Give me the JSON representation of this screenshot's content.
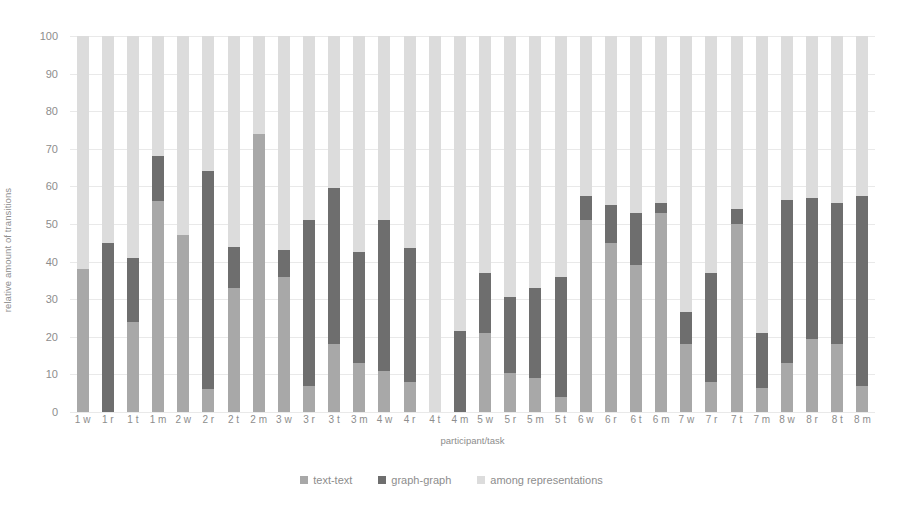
{
  "chart_data": {
    "type": "bar",
    "title": "",
    "xlabel": "participant/task",
    "ylabel": "relative amount of transitions",
    "ylim": [
      0,
      100
    ],
    "yticks": [
      0,
      10,
      20,
      30,
      40,
      50,
      60,
      70,
      80,
      90,
      100
    ],
    "grid": true,
    "stacked": true,
    "legend_position": "bottom",
    "categories": [
      "1 w",
      "1 r",
      "1 t",
      "1 m",
      "2 w",
      "2 r",
      "2 t",
      "2 m",
      "3 w",
      "3 r",
      "3 t",
      "3 m",
      "4 w",
      "4 r",
      "4 t",
      "4 m",
      "5 w",
      "5 r",
      "5 m",
      "5 t",
      "6 w",
      "6 r",
      "6 t",
      "6 m",
      "7 w",
      "7 r",
      "7 t",
      "7 m",
      "8 w",
      "8 r",
      "8 t",
      "8 m"
    ],
    "series": [
      {
        "name": "text-text",
        "color": "#a8a8a8",
        "values": [
          38,
          0,
          24,
          56,
          47,
          6,
          33,
          74,
          36,
          7,
          18,
          13,
          11,
          8,
          0,
          0,
          21,
          10.5,
          9,
          4,
          51,
          45,
          39,
          53,
          18,
          8,
          50,
          6.5,
          13,
          19.5,
          18,
          7
        ]
      },
      {
        "name": "graph-graph",
        "color": "#6e6e6e",
        "values": [
          0,
          45,
          17,
          12,
          0,
          58,
          11,
          0,
          7,
          44,
          41.5,
          29.5,
          40,
          35.5,
          0,
          21.5,
          16,
          20,
          24,
          32,
          6.5,
          10,
          14,
          2.5,
          8.5,
          29,
          4,
          14.5,
          43.5,
          37.5,
          37.5,
          50.5
        ]
      },
      {
        "name": "among representations",
        "color": "#dcdcdc",
        "values": [
          62,
          55,
          59,
          32,
          53,
          36,
          56,
          26,
          57,
          49,
          40.5,
          57.5,
          49,
          56.5,
          100,
          78.5,
          63,
          69.5,
          67,
          64,
          42.5,
          45,
          47,
          44.5,
          73.5,
          63,
          46,
          79,
          43.5,
          43,
          44.5,
          42.5
        ]
      }
    ],
    "stack_tops": {
      "text_text": [
        38,
        0,
        24,
        56,
        47,
        6,
        33,
        74,
        36,
        7,
        18,
        13,
        11,
        8,
        0,
        0,
        21,
        10.5,
        9,
        4,
        51,
        45,
        39,
        53,
        18,
        8,
        50,
        6.5,
        13,
        19.5,
        18,
        7
      ],
      "graph_graph": [
        38,
        45,
        41,
        68,
        47,
        64,
        44,
        74,
        43,
        51,
        59.5,
        42.5,
        51,
        43.5,
        0,
        21.5,
        37,
        30.5,
        33,
        36,
        57.5,
        55,
        53,
        55.5,
        26.5,
        37,
        54,
        21,
        56.5,
        57,
        55.5,
        57.5
      ]
    }
  },
  "axis": {
    "y_title": "relative amount of transitions",
    "x_title": "participant/task",
    "y_ticks": [
      "100",
      "90",
      "80",
      "70",
      "60",
      "50",
      "40",
      "30",
      "20",
      "10",
      "0"
    ]
  },
  "legend": {
    "items": [
      {
        "label": "text-text",
        "color": "#a8a8a8"
      },
      {
        "label": "graph-graph",
        "color": "#6e6e6e"
      },
      {
        "label": "among representations",
        "color": "#dcdcdc"
      }
    ]
  }
}
